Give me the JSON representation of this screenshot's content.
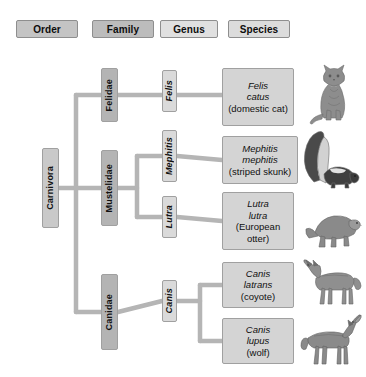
{
  "diagram": {
    "line_color": "#b5b5b5"
  },
  "columns": [
    {
      "id": "order",
      "label": "Order",
      "color": "#c4c4c4"
    },
    {
      "id": "family",
      "label": "Family",
      "color": "#bcbcbc"
    },
    {
      "id": "genus",
      "label": "Genus",
      "color": "#e0e0e0"
    },
    {
      "id": "species",
      "label": "Species",
      "color": "#dcdcdc"
    }
  ],
  "order": {
    "carnivora": "Carnivora"
  },
  "families": {
    "felidae": "Felidae",
    "mustelidae": "Mustelidae",
    "canidae": "Canidae"
  },
  "genera": {
    "felis": "Felis",
    "mephitis": "Mephitis",
    "lutra": "Lutra",
    "canis": "Canis"
  },
  "species": [
    {
      "id": "felis-catus",
      "genus_line": "Felis",
      "species_line": "catus",
      "common_name": "(domestic cat)",
      "animal": "cat-illustration"
    },
    {
      "id": "mephitis-mephitis",
      "genus_line": "Mephitis",
      "species_line": "mephitis",
      "common_name": "(striped skunk)",
      "animal": "skunk-illustration"
    },
    {
      "id": "lutra-lutra",
      "genus_line": "Lutra",
      "species_line": "lutra",
      "common_name": "(European otter)",
      "animal": "otter-illustration"
    },
    {
      "id": "canis-latrans",
      "genus_line": "Canis",
      "species_line": "latrans",
      "common_name": "(coyote)",
      "animal": "coyote-illustration"
    },
    {
      "id": "canis-lupus",
      "genus_line": "Canis",
      "species_line": "lupus",
      "common_name": "(wolf)",
      "animal": "wolf-illustration"
    }
  ]
}
